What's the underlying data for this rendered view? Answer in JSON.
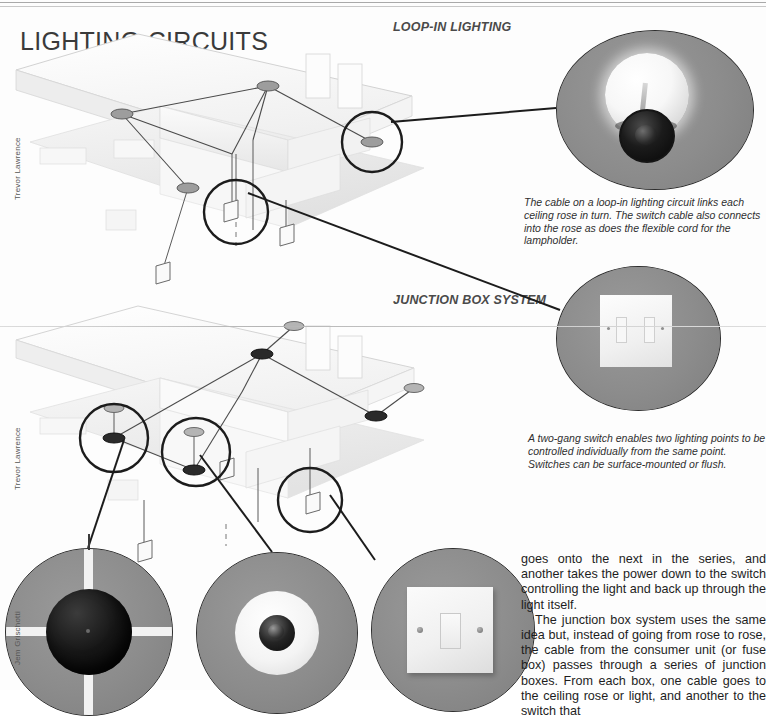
{
  "page": {
    "title": "LIGHTING CIRCUITS",
    "background_color": "#fdfdfd",
    "rule_color": "#9a9a9a"
  },
  "sections": [
    {
      "id": "loop-in",
      "label": "LOOP-IN LIGHTING"
    },
    {
      "id": "junction-box",
      "label": "JUNCTION BOX SYSTEM"
    }
  ],
  "credits": [
    {
      "name": "Trevor Lawrence"
    },
    {
      "name": "Trevor Lawrence"
    },
    {
      "name": "Jem Grischotti"
    }
  ],
  "photos": [
    {
      "id": "bulb-lampholder",
      "subject": "light bulb in lampholder",
      "background_color": "#8e8e8e"
    },
    {
      "id": "two-gang-switch",
      "subject": "two-gang switch plate",
      "background_color": "#8e8e8e"
    },
    {
      "id": "black-ceiling-rose",
      "subject": "black ceiling rose",
      "background_color": "#8e8e8e"
    },
    {
      "id": "white-ceiling-rose",
      "subject": "white ceiling rose with lampholder",
      "background_color": "#8e8e8e"
    },
    {
      "id": "one-gang-switch",
      "subject": "one-gang rocker light switch",
      "background_color": "#8e8e8e"
    }
  ],
  "captions": {
    "loop_in": "The cable on a loop-in lighting circuit links each ceiling rose in turn. The switch cable also connects into the rose as does the flexible cord for the lampholder.",
    "two_gang": "A two-gang switch enables two lighting points to be controlled individually from the same point. Switches can be surface-mounted or flush."
  },
  "body": {
    "paragraph_1": "goes onto the next in the series, and another takes the power down to the switch controlling the light and back up through the light itself.",
    "paragraph_2": "The junction box system uses the same idea but, instead of going from rose to rose, the cable from the consumer unit (or fuse box) passes through a series of junction boxes. From each box, one cable goes to the ceiling rose or light, and another to the switch that"
  }
}
